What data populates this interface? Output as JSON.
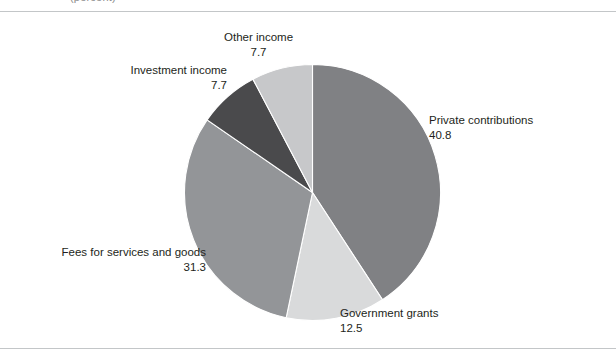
{
  "figure": {
    "top_caption": "(percent)",
    "background_color": "#ffffff",
    "rule_color": "#c3c6c8"
  },
  "chart_data": {
    "type": "pie",
    "title": "",
    "subtitle": "",
    "xlabel": "",
    "ylabel": "",
    "units": "percent",
    "total": 100.0,
    "start_angle_deg": 0,
    "direction": "clockwise",
    "legend": "none (direct labels)",
    "grid": false,
    "categories": [
      "Private contributions",
      "Government grants",
      "Fees for services and goods",
      "Investment income",
      "Other income"
    ],
    "values": [
      40.8,
      12.5,
      31.3,
      7.7,
      7.7
    ],
    "colors": [
      "#808184",
      "#d9dadb",
      "#939598",
      "#4a4a4c",
      "#c7c8ca"
    ],
    "slices": [
      {
        "label": "Private contributions",
        "value": 40.8,
        "value_text": "40.8",
        "color": "#808184",
        "start_deg": 0.0,
        "end_deg": 146.88,
        "label_position": "right"
      },
      {
        "label": "Government grants",
        "value": 12.5,
        "value_text": "12.5",
        "color": "#d9dadb",
        "start_deg": 146.88,
        "end_deg": 191.88,
        "label_position": "bottom"
      },
      {
        "label": "Fees for services and goods",
        "value": 31.3,
        "value_text": "31.3",
        "color": "#939598",
        "start_deg": 191.88,
        "end_deg": 304.56,
        "label_position": "left"
      },
      {
        "label": "Investment income",
        "value": 7.7,
        "value_text": "7.7",
        "color": "#4a4a4c",
        "start_deg": 304.56,
        "end_deg": 332.28,
        "label_position": "upper-left"
      },
      {
        "label": "Other income",
        "value": 7.7,
        "value_text": "7.7",
        "color": "#c7c8ca",
        "start_deg": 332.28,
        "end_deg": 360.0,
        "label_position": "top"
      }
    ]
  }
}
